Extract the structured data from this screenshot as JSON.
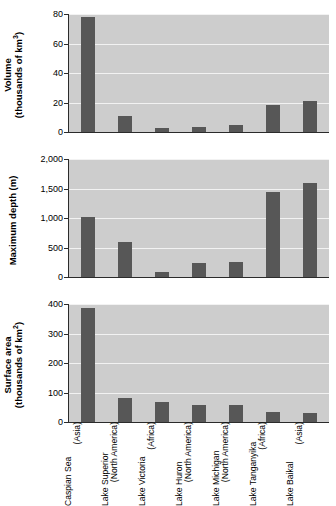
{
  "figure": {
    "name": "worlds-largest-lakes-three-panel-bar-chart"
  },
  "categories": [
    {
      "name": "Caspian Sea",
      "region": "(Asia)"
    },
    {
      "name": "Lake Superior",
      "region": "(North America)"
    },
    {
      "name": "Lake Victoria",
      "region": "(Africa)"
    },
    {
      "name": "Lake Huron",
      "region": "(North America)"
    },
    {
      "name": "Lake Michigan",
      "region": "(North America)"
    },
    {
      "name": "Lake Tanganyika",
      "region": "(Africa)"
    },
    {
      "name": "Lake Baikal",
      "region": "(Asia)"
    }
  ],
  "panels": {
    "volume": {
      "axis_title_line1": "Volume",
      "axis_title_line2": "(thousands of km",
      "axis_title_sup": "3",
      "axis_title_close": ")",
      "ticks": [
        "80",
        "60",
        "40",
        "20",
        "0"
      ]
    },
    "depth": {
      "axis_title_line1": "Maximum depth (m)",
      "ticks": [
        "2,000",
        "1,500",
        "1,000",
        "500",
        "0"
      ]
    },
    "area": {
      "axis_title_line1": "Surface area",
      "axis_title_line2": "(thousands of km",
      "axis_title_sup": "2",
      "axis_title_close": ")",
      "ticks": [
        "400",
        "300",
        "200",
        "100",
        "0"
      ]
    }
  },
  "colors": {
    "bar": "#575757",
    "plot_background": "#cdcdcd",
    "gridline": "#f2f2f2",
    "axis": "#2b2b2b",
    "page_background": "#ffffff"
  },
  "chart_data": [
    {
      "type": "bar",
      "title": "",
      "xlabel": "",
      "ylabel": "Volume (thousands of km^3)",
      "categories": [
        "Caspian Sea (Asia)",
        "Lake Superior (North America)",
        "Lake Victoria (Africa)",
        "Lake Huron (North America)",
        "Lake Michigan (North America)",
        "Lake Tanganyika (Africa)",
        "Lake Baikal (Asia)"
      ],
      "values": [
        78,
        11,
        2.5,
        3.5,
        5,
        18,
        21
      ],
      "ylim": [
        0,
        80
      ],
      "yticks": [
        0,
        20,
        40,
        60,
        80
      ],
      "grid": true,
      "legend": "none"
    },
    {
      "type": "bar",
      "title": "",
      "xlabel": "",
      "ylabel": "Maximum depth (m)",
      "categories": [
        "Caspian Sea (Asia)",
        "Lake Superior (North America)",
        "Lake Victoria (Africa)",
        "Lake Huron (North America)",
        "Lake Michigan (North America)",
        "Lake Tanganyika (Africa)",
        "Lake Baikal (Asia)"
      ],
      "values": [
        1025,
        590,
        85,
        230,
        250,
        1440,
        1600
      ],
      "ylim": [
        0,
        2000
      ],
      "yticks": [
        0,
        500,
        1000,
        1500,
        2000
      ],
      "grid": true,
      "legend": "none"
    },
    {
      "type": "bar",
      "title": "",
      "xlabel": "",
      "ylabel": "Surface area (thousands of km^2)",
      "categories": [
        "Caspian Sea (Asia)",
        "Lake Superior (North America)",
        "Lake Victoria (Africa)",
        "Lake Huron (North America)",
        "Lake Michigan (North America)",
        "Lake Tanganyika (Africa)",
        "Lake Baikal (Asia)"
      ],
      "values": [
        386,
        82,
        69,
        59,
        58,
        33,
        31
      ],
      "ylim": [
        0,
        400
      ],
      "yticks": [
        0,
        100,
        200,
        300,
        400
      ],
      "grid": true,
      "legend": "none"
    }
  ]
}
